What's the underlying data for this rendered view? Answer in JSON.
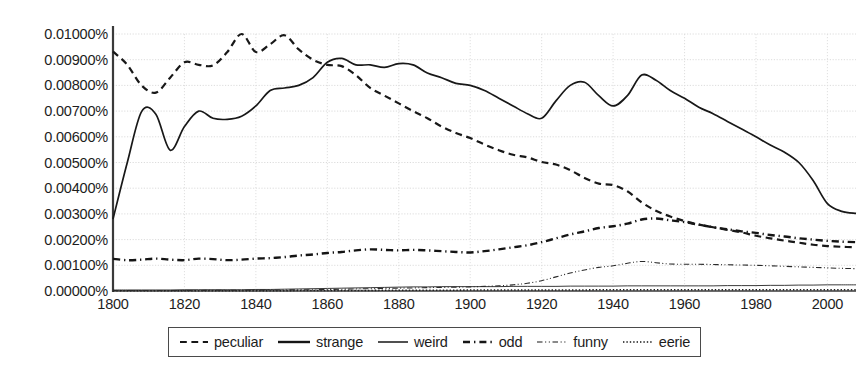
{
  "chart_data": {
    "type": "line",
    "title": "",
    "xlabel": "",
    "ylabel": "",
    "xlim": [
      1800,
      2008
    ],
    "ylim": [
      0.0,
      0.01
    ],
    "grid": true,
    "legend_position": "bottom",
    "y_tick_labels": [
      "0.01000%",
      "0.00900%",
      "0.00800%",
      "0.00700%",
      "0.00600%",
      "0.00500%",
      "0.00400%",
      "0.00300%",
      "0.00200%",
      "0.00100%",
      "0.00000%"
    ],
    "y_tick_values": [
      0.01,
      0.009,
      0.008,
      0.007,
      0.006,
      0.005,
      0.004,
      0.003,
      0.002,
      0.001,
      0.0
    ],
    "x_tick_labels": [
      "1800",
      "1820",
      "1840",
      "1860",
      "1880",
      "1900",
      "1920",
      "1940",
      "1960",
      "1980",
      "2000"
    ],
    "x_tick_values": [
      1800,
      1820,
      1840,
      1860,
      1880,
      1900,
      1920,
      1940,
      1960,
      1980,
      2000
    ],
    "x": [
      1800,
      1804,
      1808,
      1812,
      1816,
      1820,
      1824,
      1828,
      1832,
      1836,
      1840,
      1844,
      1848,
      1852,
      1856,
      1860,
      1864,
      1868,
      1872,
      1876,
      1880,
      1884,
      1888,
      1892,
      1896,
      1900,
      1904,
      1908,
      1912,
      1916,
      1920,
      1924,
      1928,
      1932,
      1936,
      1940,
      1944,
      1948,
      1952,
      1956,
      1960,
      1964,
      1968,
      1972,
      1976,
      1980,
      1984,
      1988,
      1992,
      1996,
      2000,
      2004,
      2008
    ],
    "series": [
      {
        "name": "peculiar",
        "style": "dashed",
        "width": 2.2,
        "color": "#181818",
        "values": [
          0.00932,
          0.0088,
          0.008,
          0.00772,
          0.0083,
          0.0089,
          0.0088,
          0.00878,
          0.0093,
          0.01,
          0.0093,
          0.0096,
          0.00995,
          0.0094,
          0.009,
          0.0088,
          0.00875,
          0.0084,
          0.0079,
          0.0076,
          0.0073,
          0.007,
          0.00672,
          0.0064,
          0.00615,
          0.00595,
          0.0057,
          0.00548,
          0.0053,
          0.0052,
          0.00502,
          0.00492,
          0.0047,
          0.0044,
          0.00418,
          0.00412,
          0.00388,
          0.00345,
          0.00312,
          0.0029,
          0.00272,
          0.00258,
          0.00248,
          0.00238,
          0.00228,
          0.00215,
          0.00205,
          0.00196,
          0.00188,
          0.0018,
          0.00175,
          0.00172,
          0.0017
        ]
      },
      {
        "name": "strange",
        "style": "solid",
        "width": 1.7,
        "color": "#181818",
        "values": [
          0.0028,
          0.005,
          0.00698,
          0.00688,
          0.00548,
          0.0064,
          0.007,
          0.00672,
          0.00668,
          0.0068,
          0.0072,
          0.0078,
          0.0079,
          0.008,
          0.0083,
          0.0089,
          0.00905,
          0.0088,
          0.0088,
          0.0087,
          0.00885,
          0.0088,
          0.00848,
          0.0083,
          0.00808,
          0.008,
          0.0078,
          0.0075,
          0.0072,
          0.0069,
          0.00672,
          0.0074,
          0.008,
          0.00812,
          0.0076,
          0.0072,
          0.0076,
          0.0084,
          0.0082,
          0.0078,
          0.0075,
          0.00715,
          0.0069,
          0.0066,
          0.0063,
          0.006,
          0.00568,
          0.0054,
          0.005,
          0.0043,
          0.0034,
          0.0031,
          0.00302
        ]
      },
      {
        "name": "weird",
        "style": "solid",
        "width": 0.9,
        "color": "#242424",
        "values": [
          4e-05,
          4e-05,
          4e-05,
          4e-05,
          4e-05,
          5e-05,
          5e-05,
          5e-05,
          5e-05,
          5e-05,
          6e-05,
          6e-05,
          7e-05,
          8e-05,
          9e-05,
          0.0001,
          0.00011,
          0.00012,
          0.00013,
          0.00014,
          0.00015,
          0.00016,
          0.00016,
          0.00017,
          0.00017,
          0.00017,
          0.00017,
          0.00017,
          0.00018,
          0.00018,
          0.00018,
          0.00018,
          0.00019,
          0.00019,
          0.00019,
          0.00019,
          0.0002,
          0.0002,
          0.0002,
          0.0002,
          0.0002,
          0.0002,
          0.0002,
          0.00021,
          0.00021,
          0.00021,
          0.00022,
          0.00022,
          0.00023,
          0.00023,
          0.00024,
          0.00024,
          0.00024
        ]
      },
      {
        "name": "odd",
        "style": "dashdot",
        "width": 2.4,
        "color": "#141414",
        "values": [
          0.00125,
          0.0012,
          0.00122,
          0.00126,
          0.00122,
          0.0012,
          0.00126,
          0.00124,
          0.0012,
          0.00122,
          0.00126,
          0.00128,
          0.00132,
          0.00138,
          0.00142,
          0.00148,
          0.00152,
          0.00158,
          0.00162,
          0.0016,
          0.00158,
          0.0016,
          0.00158,
          0.00155,
          0.00152,
          0.0015,
          0.00155,
          0.00162,
          0.0017,
          0.00178,
          0.0019,
          0.00205,
          0.0022,
          0.00232,
          0.00245,
          0.00252,
          0.00262,
          0.00278,
          0.00282,
          0.00275,
          0.00268,
          0.00258,
          0.00248,
          0.0024,
          0.00232,
          0.00226,
          0.00218,
          0.00212,
          0.00205,
          0.002,
          0.00195,
          0.00192,
          0.0019
        ]
      },
      {
        "name": "funny",
        "style": "dashdotdot",
        "width": 1.1,
        "color": "#2a2a2a",
        "values": [
          2e-05,
          2e-05,
          2e-05,
          2e-05,
          2e-05,
          2e-05,
          2e-05,
          3e-05,
          3e-05,
          3e-05,
          3e-05,
          4e-05,
          4e-05,
          5e-05,
          5e-05,
          6e-05,
          7e-05,
          8e-05,
          9e-05,
          0.0001,
          0.00011,
          0.00012,
          0.00013,
          0.00014,
          0.00015,
          0.00016,
          0.00018,
          0.0002,
          0.00024,
          0.0003,
          0.0004,
          0.00055,
          0.0007,
          0.00082,
          0.00092,
          0.00098,
          0.00108,
          0.00115,
          0.0011,
          0.00105,
          0.00104,
          0.00104,
          0.00103,
          0.00102,
          0.00101,
          0.001,
          0.00098,
          0.00096,
          0.00094,
          0.00092,
          0.0009,
          0.00088,
          0.00087
        ]
      },
      {
        "name": "eerie",
        "style": "dotted",
        "width": 1.6,
        "color": "#1f1f1f",
        "values": [
          1e-05,
          1e-05,
          1e-05,
          1e-05,
          1e-05,
          1e-05,
          1e-05,
          1e-05,
          1e-05,
          1e-05,
          1e-05,
          1e-05,
          1e-05,
          2e-05,
          2e-05,
          2e-05,
          2e-05,
          2e-05,
          2e-05,
          3e-05,
          3e-05,
          3e-05,
          3e-05,
          3e-05,
          3e-05,
          4e-05,
          4e-05,
          4e-05,
          4e-05,
          4e-05,
          4e-05,
          4e-05,
          4e-05,
          4e-05,
          5e-05,
          5e-05,
          5e-05,
          5e-05,
          5e-05,
          5e-05,
          5e-05,
          5e-05,
          5e-05,
          5e-05,
          5e-05,
          5e-05,
          5e-05,
          5e-05,
          5e-05,
          5e-05,
          5e-05,
          5e-05,
          5e-05
        ]
      }
    ]
  },
  "legend": {
    "items": [
      {
        "label": "peculiar",
        "style": "dashed"
      },
      {
        "label": "strange",
        "style": "solid-bold"
      },
      {
        "label": "weird",
        "style": "solid-thin"
      },
      {
        "label": "odd",
        "style": "dashdot"
      },
      {
        "label": "funny",
        "style": "dashdotdot"
      },
      {
        "label": "eerie",
        "style": "dotted"
      }
    ]
  }
}
